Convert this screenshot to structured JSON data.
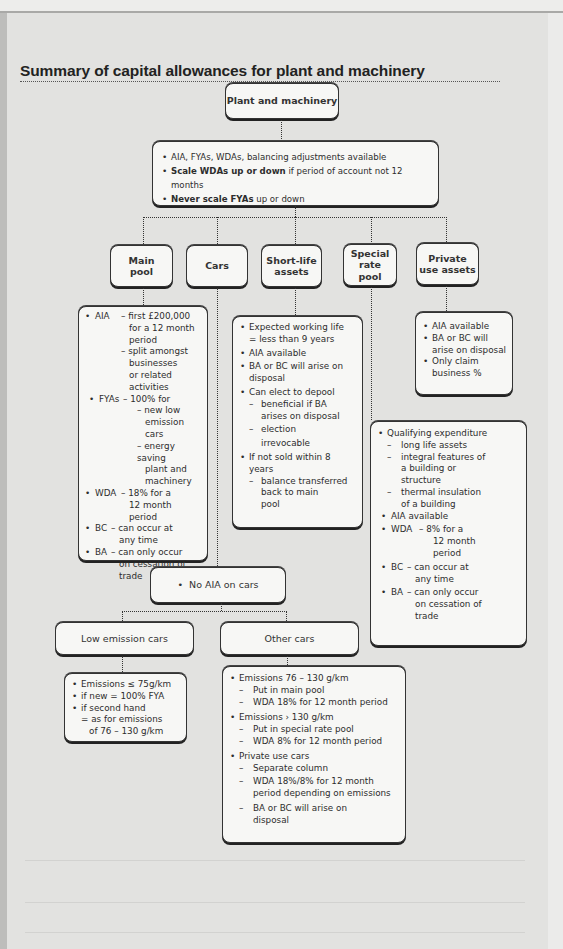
{
  "page": {
    "title": "Summary of capital allowances for plant and machinery"
  },
  "root": {
    "label": "Plant and machinery",
    "points": [
      {
        "bold": "",
        "text": "AIA, FYAs, WDAs, balancing adjustments available"
      },
      {
        "bold": "Scale WDAs up or down",
        "text": " if period of account not 12 months"
      },
      {
        "bold": "Never scale FYAs",
        "text": " up or down"
      }
    ]
  },
  "categories": [
    {
      "label_line1": "Main",
      "label_line2": "pool"
    },
    {
      "label_line1": "Cars",
      "label_line2": ""
    },
    {
      "label_line1": "Short-life",
      "label_line2": "assets"
    },
    {
      "label_line1": "Special rate",
      "label_line2": "pool"
    },
    {
      "label_line1": "Private",
      "label_line2": "use assets"
    }
  ],
  "main_pool": {
    "aia_label": "AIA",
    "aia_1": "– first £200,000",
    "aia_1b": "for a 12 month",
    "aia_1c": "period",
    "aia_2": "– split amongst",
    "aia_2b": "businesses",
    "aia_2c": "or related",
    "aia_2d": "activities",
    "fya_label": "FYAs",
    "fya_1": "– 100% for",
    "fya_2": "– new low",
    "fya_2b": "emission cars",
    "fya_3": "– energy saving",
    "fya_3b": "plant and",
    "fya_3c": "machinery",
    "wda_label": "WDA",
    "wda_1": "– 18% for a",
    "wda_1b": "12 month",
    "wda_1c": "period",
    "bc_label": "BC",
    "bc_1": "– can occur at",
    "bc_1b": "any time",
    "ba_label": "BA",
    "ba_1": "– can only occur",
    "ba_1b": "on cessation of",
    "ba_1c": "trade"
  },
  "short_life": {
    "p1": "Expected working life",
    "p1b": "=  less than 9 years",
    "p2": "AIA available",
    "p3": "BA or BC will arise on",
    "p3b": "disposal",
    "p4": "Can elect to depool",
    "p4_s1": "beneficial if BA",
    "p4_s1b": "arises on disposal",
    "p4_s2": "election",
    "p4_s2b": "irrevocable",
    "p5": "If not sold within 8",
    "p5b": "years",
    "p5_s1": "balance transferred",
    "p5_s1b": "back to main",
    "p5_s1c": "pool"
  },
  "private_use": {
    "p1": "AIA available",
    "p2": "BA or BC will",
    "p2b": "arise on disposal",
    "p3": "Only claim",
    "p3b": "business %"
  },
  "special_rate": {
    "p1": "Qualifying expenditure",
    "p1_s1": "long life assets",
    "p1_s2": "integral features of",
    "p1_s2b": "a building or",
    "p1_s2c": "structure",
    "p1_s3": "thermal insulation",
    "p1_s3b": "of a building",
    "p2": "AIA available",
    "wda_label": "WDA",
    "wda_1": "– 8% for a",
    "wda_1b": "12 month",
    "wda_1c": "period",
    "bc_label": "BC",
    "bc_1": "– can occur at",
    "bc_1b": "any time",
    "ba_label": "BA",
    "ba_1": "– can only occur",
    "ba_1b": "on cessation of",
    "ba_1c": "trade"
  },
  "cars": {
    "no_aia": "No AIA on cars",
    "low_emission": {
      "label": "Low emission cars",
      "p1": "Emissions ≤ 75g/km",
      "p2": "if new = 100% FYA",
      "p3": "if second hand",
      "p3b": "= as for emissions",
      "p3c": "of 76 – 130 g/km"
    },
    "other": {
      "label": "Other cars",
      "p1": "Emissions  76 – 130 g/km",
      "p1_s1": "Put in main pool",
      "p1_s2": "WDA 18% for 12 month period",
      "p2": "Emissions › 130 g/km",
      "p2_s1": "Put in special rate pool",
      "p2_s2": "WDA 8% for 12 month period",
      "p3": "Private use cars",
      "p3_s1": "Separate column",
      "p3_s2": "WDA 18%/8% for 12 month",
      "p3_s2b": "period depending on emissions",
      "p3_s3": "BA or BC will arise on",
      "p3_s3b": "disposal"
    }
  }
}
